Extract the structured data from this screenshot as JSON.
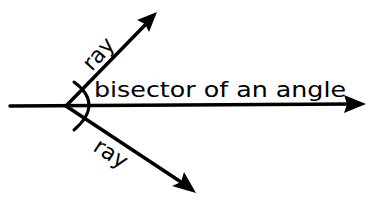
{
  "diagram": {
    "type": "geometry-angle-bisector",
    "colors": {
      "background": "#ffffff",
      "stroke": "#000000"
    },
    "labels": {
      "upper_ray": "ray",
      "lower_ray": "ray",
      "bisector": "bisector of an angle"
    },
    "elements": [
      {
        "id": "upper-ray",
        "kind": "ray",
        "label": "ray"
      },
      {
        "id": "bisector",
        "kind": "ray",
        "label": "bisector of an angle"
      },
      {
        "id": "lower-ray",
        "kind": "ray",
        "label": "ray"
      },
      {
        "id": "angle-arc",
        "kind": "arc"
      }
    ]
  }
}
